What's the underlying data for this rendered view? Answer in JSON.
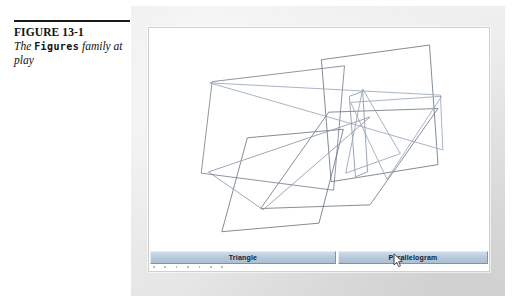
{
  "figure": {
    "number": "FIGURE 13-1",
    "caption_prefix": "The ",
    "caption_code": "Figures",
    "caption_suffix": " family at play"
  },
  "window": {
    "canvas_background": "#ffffff",
    "page_background": "#e9e9e9"
  },
  "buttons": [
    {
      "name": "triangle",
      "label": "Triangle"
    },
    {
      "name": "parallelogram",
      "label": "Parallelogram"
    }
  ],
  "cursor": {
    "icon": "arrow-pointer-cursor",
    "x": 244,
    "y": 3
  },
  "drawing": {
    "stroke_color_dark": "#6b7480",
    "stroke_color_light": "#9aa8b8",
    "stroke_width": 0.7,
    "shapes": [
      {
        "name": "parallelogram-left-large",
        "type": "parallelogram",
        "stroke": "#7b8490",
        "points": "52,44 161,31 152,133 43,119"
      },
      {
        "name": "parallelogram-upper-right",
        "type": "parallelogram",
        "stroke": "#6e7884",
        "points": "142,26 231,14 238,112 150,126"
      },
      {
        "name": "triangle-wide-flat",
        "type": "triangle",
        "stroke": "#9aa8b8",
        "points": "50,45 240,55 242,100"
      },
      {
        "name": "parallelogram-center-lower",
        "type": "parallelogram",
        "stroke": "#6e7884",
        "points": "81,90 160,83 140,160 60,167"
      },
      {
        "name": "parallelogram-big-bottom",
        "type": "parallelogram",
        "stroke": "#717a86",
        "points": "148,69 238,66 182,145 92,148"
      },
      {
        "name": "triangle-sliver-right",
        "type": "triangle",
        "stroke": "#9aa8b8",
        "points": "166,61 241,56 196,124"
      },
      {
        "name": "parallelogram-narrow-vertical",
        "type": "parallelogram",
        "stroke": "#8b96a3",
        "points": "165,56 176,52 180,118 170,122"
      },
      {
        "name": "triangle-narrow-right",
        "type": "triangle",
        "stroke": "#97a4b3",
        "points": "176,50 207,103 162,119"
      },
      {
        "name": "triangle-long-left",
        "type": "triangle",
        "stroke": "#8d99a7",
        "points": "49,118 182,73 94,149"
      }
    ]
  }
}
